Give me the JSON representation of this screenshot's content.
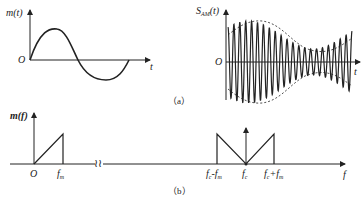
{
  "figure": {
    "panel_a": {
      "caption": "（a）",
      "left_plot": {
        "y_label": "m(t)",
        "origin_label": "O",
        "x_label": "t",
        "description": "one cycle of a sinusoidal message signal"
      },
      "right_plot": {
        "y_label_main": "S",
        "y_label_sub": "AM",
        "y_label_arg": "(t)",
        "origin_label": "O",
        "x_label": "t",
        "description": "AM modulated waveform with dashed envelope following the message"
      }
    },
    "panel_b": {
      "caption": "（b）",
      "y_label": "m(f)",
      "x_label": "f",
      "ticks": {
        "origin": "O",
        "fm": "f",
        "fm_sub": "m",
        "fc_minus_fm": "f",
        "fc_minus_fm_sub1": "c",
        "fc_minus_fm_mid": "-f",
        "fc_minus_fm_sub2": "m",
        "fc": "f",
        "fc_sub": "c",
        "fc_plus_fm": "f",
        "fc_plus_fm_sub1": "c",
        "fc_plus_fm_mid": "+f",
        "fc_plus_fm_sub2": "m"
      },
      "break_symbol": "≀≀",
      "description": "baseband spectrum triangle 0..fm; AM spectrum with sidebands fc-fm..fc+fm and carrier impulse at fc"
    }
  }
}
